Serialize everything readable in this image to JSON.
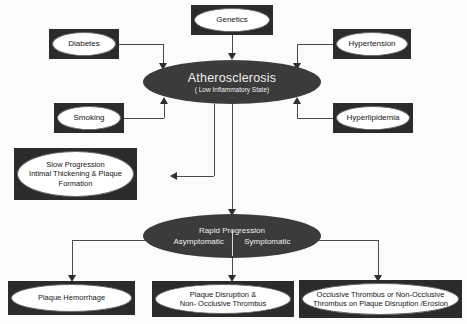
{
  "diagram": {
    "colors": {
      "background": "#fbfbfa",
      "node_frame": "#2b2b2b",
      "node_fill": "#ffffff",
      "ellipse_fill": "#3b3b3b",
      "ellipse_text": "#efefef",
      "connector": "#4a4a4a"
    },
    "risk_factors": [
      {
        "id": "genetics",
        "label": "Genetics"
      },
      {
        "id": "diabetes",
        "label": "Diabetes"
      },
      {
        "id": "hypertension",
        "label": "Hypertension"
      },
      {
        "id": "smoking",
        "label": "Smoking"
      },
      {
        "id": "hyperlipidemia",
        "label": "Hyperlipidemia"
      }
    ],
    "central": {
      "label": "Atherosclerosis",
      "sublabel": "( Low Inflammatory State)"
    },
    "slow_progression": {
      "line1": "Slow Progression",
      "line2": "Intimal Thickening & Plaque",
      "line3": "Formation"
    },
    "rapid_progression": {
      "label": "Rapid Progression",
      "left_state": "Asymptomatic",
      "right_state": "Symptomatic"
    },
    "outcomes": [
      {
        "id": "plaque-hemorrhage",
        "line1": "Plaque Hemorrhage",
        "line2": ""
      },
      {
        "id": "plaque-disruption",
        "line1": "Plaque Disruption &",
        "line2": "Non- Occlusive Thrombus"
      },
      {
        "id": "occlusive-thrombus",
        "line1": "Occlusive Thrombus or Non-Occlusive",
        "line2": "Thrombus on Plaque Disruption /Erosion"
      }
    ]
  }
}
